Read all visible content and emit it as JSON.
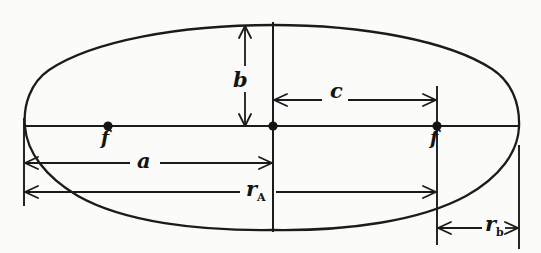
{
  "figure": {
    "kind": "ellipse-orbit-geometry-diagram",
    "style": "hand-drawn line art",
    "background_color": "#fbfbf9",
    "ink_color": "#1b1b1b",
    "canvas": {
      "width": 541,
      "height": 253
    }
  },
  "ellipse": {
    "center": {
      "x": 273,
      "y": 126
    },
    "semi_major_axis_px": 249,
    "semi_minor_axis_px": 101,
    "left_vertex": {
      "x": 24,
      "y": 126
    },
    "right_vertex": {
      "x": 519,
      "y": 126
    },
    "top_co_vertex": {
      "x": 273,
      "y": 25
    },
    "bottom_co_vertex": {
      "x": 273,
      "y": 229
    }
  },
  "foci": [
    {
      "id": "left-focus",
      "label": "f",
      "x": 108,
      "y": 126,
      "label_position": "below"
    },
    {
      "id": "right-focus",
      "label": "f",
      "x": 437,
      "y": 126,
      "label_position": "below"
    }
  ],
  "labels": {
    "semi_minor": "b",
    "focal_distance": "c",
    "semi_major": "a",
    "focus": "f",
    "apoapsis_radius": "r",
    "apoapsis_radius_subscript": "A",
    "periapsis_radius": "r",
    "periapsis_radius_subscript": "b"
  },
  "dimensions": [
    {
      "name": "semi-minor-axis",
      "label": "b",
      "orientation": "vertical",
      "from": {
        "x": 245,
        "y": 25
      },
      "to": {
        "x": 245,
        "y": 126
      },
      "arrowheads": "both"
    },
    {
      "name": "center-to-focus",
      "label": "c",
      "orientation": "horizontal",
      "from": {
        "x": 273,
        "y": 100
      },
      "to": {
        "x": 437,
        "y": 100
      },
      "arrowheads": "both"
    },
    {
      "name": "semi-major-axis",
      "label": "a",
      "orientation": "horizontal",
      "from": {
        "x": 24,
        "y": 163
      },
      "to": {
        "x": 273,
        "y": 163
      },
      "arrowheads": "both"
    },
    {
      "name": "apoapsis-radius",
      "label": "r_A",
      "orientation": "horizontal",
      "from": {
        "x": 24,
        "y": 192
      },
      "to": {
        "x": 437,
        "y": 192
      },
      "arrowheads": "both"
    },
    {
      "name": "periapsis-radius",
      "label": "r_b",
      "orientation": "horizontal",
      "from": {
        "x": 437,
        "y": 228
      },
      "to": {
        "x": 519,
        "y": 228
      },
      "arrowheads": "both"
    }
  ],
  "construction_lines": [
    {
      "name": "major-axis-line",
      "from": {
        "x": 24,
        "y": 126
      },
      "to": {
        "x": 519,
        "y": 126
      }
    },
    {
      "name": "minor-axis-line",
      "from": {
        "x": 273,
        "y": 22
      },
      "to": {
        "x": 273,
        "y": 232
      }
    },
    {
      "name": "left-vertex-extension",
      "from": {
        "x": 24,
        "y": 120
      },
      "to": {
        "x": 24,
        "y": 205
      }
    },
    {
      "name": "right-focus-extension",
      "from": {
        "x": 437,
        "y": 88
      },
      "to": {
        "x": 437,
        "y": 243
      }
    },
    {
      "name": "right-vertex-extension",
      "from": {
        "x": 519,
        "y": 145
      },
      "to": {
        "x": 519,
        "y": 248
      }
    }
  ]
}
